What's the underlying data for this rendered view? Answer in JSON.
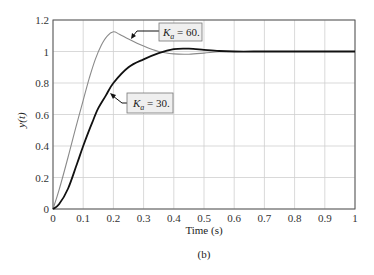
{
  "chart_data": {
    "type": "line",
    "title": "",
    "caption": "(b)",
    "xlabel": "Time (s)",
    "ylabel": "y(t)",
    "xlim": [
      0,
      1
    ],
    "ylim": [
      0,
      1.2
    ],
    "grid": true,
    "x_ticks": [
      "0",
      "0.1",
      "0.2",
      "0.3",
      "0.4",
      "0.5",
      "0.6",
      "0.7",
      "0.8",
      "0.9",
      "1"
    ],
    "y_ticks": [
      "0",
      "0.2",
      "0.4",
      "0.6",
      "0.8",
      "1",
      "1.2"
    ],
    "series": [
      {
        "name": "Ka = 60.",
        "color": "#8a8a8a",
        "x": [
          0,
          0.02,
          0.05,
          0.08,
          0.1,
          0.12,
          0.14,
          0.16,
          0.18,
          0.2,
          0.22,
          0.25,
          0.3,
          0.35,
          0.4,
          0.45,
          0.5,
          0.55,
          0.6,
          0.7,
          0.8,
          0.9,
          1.0
        ],
        "values": [
          0,
          0.12,
          0.33,
          0.55,
          0.69,
          0.83,
          0.95,
          1.04,
          1.1,
          1.125,
          1.11,
          1.08,
          1.035,
          1.0,
          0.985,
          0.983,
          0.99,
          0.998,
          1.0,
          1.0,
          1.0,
          1.0,
          1.0
        ]
      },
      {
        "name": "Ka = 30.",
        "color": "#111111",
        "x": [
          0,
          0.02,
          0.05,
          0.08,
          0.1,
          0.13,
          0.15,
          0.175,
          0.2,
          0.25,
          0.3,
          0.35,
          0.4,
          0.45,
          0.5,
          0.55,
          0.6,
          0.7,
          0.8,
          0.9,
          1.0
        ],
        "values": [
          0,
          0.03,
          0.13,
          0.29,
          0.4,
          0.55,
          0.64,
          0.72,
          0.8,
          0.9,
          0.95,
          0.99,
          1.015,
          1.018,
          1.01,
          1.003,
          1.0,
          1.0,
          1.0,
          1.0,
          1.0
        ]
      }
    ],
    "annotations": [
      {
        "k": "K",
        "sub": "a",
        "text": " = 60.",
        "series": "Ka = 60."
      },
      {
        "k": "K",
        "sub": "a",
        "text": " = 30.",
        "series": "Ka = 30."
      }
    ]
  }
}
